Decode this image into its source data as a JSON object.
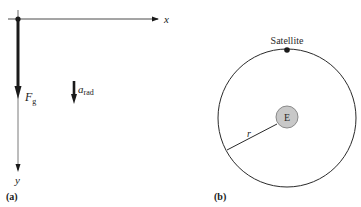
{
  "panel_a": {
    "caption": "(a)",
    "x_axis_label": "x",
    "y_axis_label": "y",
    "force": {
      "symbol": "F",
      "subscript": "g"
    },
    "acceleration": {
      "symbol": "a",
      "subscript": "rad"
    }
  },
  "panel_b": {
    "caption": "(b)",
    "satellite_label": "Satellite",
    "earth_label": "E",
    "radius_label": "r"
  },
  "colors": {
    "ink": "#1a1a1a",
    "thin_axis": "#6b6b6b",
    "earth_fill": "#c8c8c8",
    "earth_stroke": "#8a8a8a"
  }
}
